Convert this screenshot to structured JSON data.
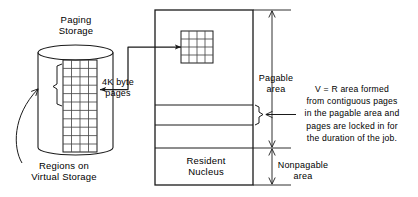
{
  "figure": {
    "type": "technical-diagram"
  },
  "labels": {
    "paging_storage": "Paging\nStorage",
    "four_k_pages": "4K byte\npages",
    "regions_on_virtual_storage": "Regions on\nVirtual Storage",
    "resident_nucleus": "Resident\nNucleus",
    "pagable_area": "Pagable\narea",
    "nonpagable_area": "Nonpagable\narea",
    "vr_note": "V = R area formed\nfrom contiguous pages\nin the pagable area and\npages are locked in for\nthe duration of the job."
  },
  "shapes": {
    "paging_storage_cylinder": {
      "left": 38,
      "right": 113,
      "top": 45,
      "bottom": 155,
      "ellipse_ry": 7.5
    },
    "virtual_pages_grid": {
      "left": 63,
      "top": 60,
      "right": 97,
      "bottom": 152,
      "columns": 4,
      "rows": 11
    },
    "real_storage_box": {
      "left": 155,
      "top": 10,
      "right": 253,
      "bottom": 185,
      "dividers": [
        105,
        125,
        148
      ]
    },
    "real_pages_grid": {
      "left": 181,
      "top": 31,
      "right": 213,
      "bottom": 63,
      "columns": 4,
      "rows": 4
    },
    "dimension_axis_x": 272,
    "pagable_span": {
      "top": 10,
      "bottom": 148
    },
    "nonpagable_span": {
      "top": 148,
      "bottom": 185
    }
  },
  "colors": {
    "ink": "#1a1a1a",
    "background": "#ffffff",
    "grid_line": "#4a4a4a"
  }
}
